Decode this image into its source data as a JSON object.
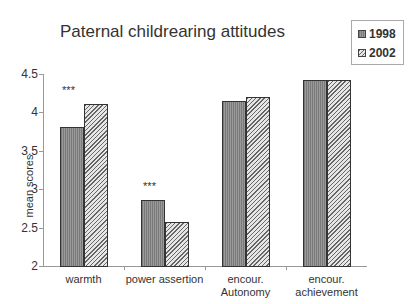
{
  "chart_data": {
    "type": "bar",
    "title": "Paternal childrearing attitudes",
    "xlabel": "",
    "ylabel": "mean scores",
    "ylim": [
      2,
      4.5
    ],
    "yticks": [
      "2",
      "2.5",
      "3",
      "3.5",
      "4",
      "4.5"
    ],
    "categories": [
      "warmth",
      "power assertion",
      "encour. Autonomy",
      "encour. achievement"
    ],
    "category_labels": [
      [
        "warmth"
      ],
      [
        "power assertion"
      ],
      [
        "encour.",
        "Autonomy"
      ],
      [
        "encour.",
        "achievement"
      ]
    ],
    "series": [
      {
        "name": "1998",
        "values": [
          3.8,
          2.86,
          4.14,
          4.42
        ]
      },
      {
        "name": "2002",
        "values": [
          4.1,
          2.57,
          4.2,
          4.42
        ]
      }
    ],
    "annotations": [
      {
        "category": "warmth",
        "text": "***"
      },
      {
        "category": "power assertion",
        "text": "***"
      }
    ],
    "grid": false,
    "legend_position": "top-right"
  }
}
